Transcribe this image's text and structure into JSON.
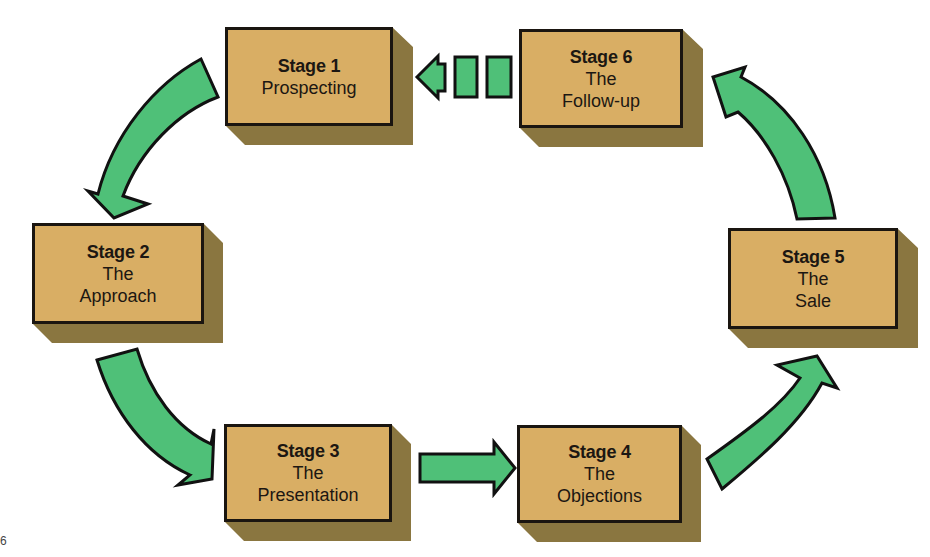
{
  "diagram": {
    "type": "cycle",
    "colors": {
      "box_fill": "#d9ae64",
      "box_border": "#1a1510",
      "box_shadow": "#8a7640",
      "arrow_fill": "#4fc078",
      "arrow_stroke": "#111111"
    },
    "stages": [
      {
        "id": "stage1",
        "number_label": "Stage 1",
        "name_lines": [
          "Prospecting"
        ]
      },
      {
        "id": "stage2",
        "number_label": "Stage 2",
        "name_lines": [
          "The",
          "Approach"
        ]
      },
      {
        "id": "stage3",
        "number_label": "Stage 3",
        "name_lines": [
          "The",
          "Presentation"
        ]
      },
      {
        "id": "stage4",
        "number_label": "Stage 4",
        "name_lines": [
          "The",
          "Objections"
        ]
      },
      {
        "id": "stage5",
        "number_label": "Stage 5",
        "name_lines": [
          "The",
          "Sale"
        ]
      },
      {
        "id": "stage6",
        "number_label": "Stage 6",
        "name_lines": [
          "The",
          "Follow-up"
        ]
      }
    ],
    "connections": [
      {
        "from": "Stage 1",
        "to": "Stage 2",
        "style": "curved-solid"
      },
      {
        "from": "Stage 2",
        "to": "Stage 3",
        "style": "curved-solid"
      },
      {
        "from": "Stage 3",
        "to": "Stage 4",
        "style": "straight-solid"
      },
      {
        "from": "Stage 4",
        "to": "Stage 5",
        "style": "curved-solid"
      },
      {
        "from": "Stage 5",
        "to": "Stage 6",
        "style": "curved-solid"
      },
      {
        "from": "Stage 6",
        "to": "Stage 1",
        "style": "dashed-segments"
      }
    ],
    "figure_marker": "6"
  }
}
